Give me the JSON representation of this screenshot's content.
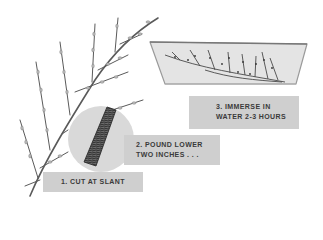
{
  "illustration": {
    "subject": "willow branch forcing instructions",
    "colors": {
      "background": "#ffffff",
      "label_bg": "#cfcfcf",
      "label_text": "#3a3a3a",
      "circle_bg": "#d9d9d9",
      "basin_water": "#e4e4e4",
      "branch": "#5a5a5a",
      "bud": "#b8b8b8"
    }
  },
  "steps": [
    {
      "number": "1.",
      "lines": [
        "1. CUT AT SLANT"
      ]
    },
    {
      "number": "2.",
      "lines": [
        "2. POUND LOWER",
        "TWO INCHES . . ."
      ]
    },
    {
      "number": "3.",
      "lines": [
        "3. IMMERSE IN",
        "WATER 2-3 HOURS"
      ]
    }
  ]
}
